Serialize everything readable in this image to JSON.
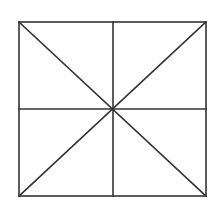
{
  "diagram": {
    "type": "square-with-diagonals-and-midlines",
    "stroke_color": "#333333",
    "background": "#ffffff",
    "square": {
      "x1": 19,
      "y1": 22,
      "x2": 206,
      "y2": 196
    },
    "center": {
      "x": 113,
      "y": 109
    }
  }
}
